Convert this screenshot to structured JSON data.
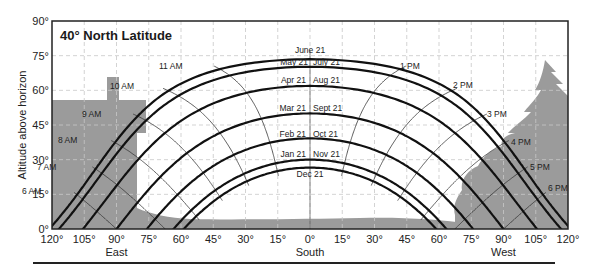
{
  "chart_data": {
    "type": "line",
    "title": "40° North Latitude",
    "xlabel": "Azimuth (East – South – West)",
    "ylabel": "Altitude above horizon",
    "latitude": 40,
    "xlim": [
      -120,
      120
    ],
    "ylim": [
      0,
      90
    ],
    "grid": true,
    "x_ticks": [
      {
        "value": -120,
        "label": "120°"
      },
      {
        "value": -105,
        "label": "105°"
      },
      {
        "value": -90,
        "label": "90°"
      },
      {
        "value": -75,
        "label": "75°"
      },
      {
        "value": -60,
        "label": "60°"
      },
      {
        "value": -45,
        "label": "45°"
      },
      {
        "value": -30,
        "label": "30°"
      },
      {
        "value": -15,
        "label": "15°"
      },
      {
        "value": 0,
        "label": "0°"
      },
      {
        "value": 15,
        "label": "15°"
      },
      {
        "value": 30,
        "label": "30°"
      },
      {
        "value": 45,
        "label": "45°"
      },
      {
        "value": 60,
        "label": "60°"
      },
      {
        "value": 75,
        "label": "75°"
      },
      {
        "value": 90,
        "label": "90°"
      },
      {
        "value": 105,
        "label": "105°"
      },
      {
        "value": 120,
        "label": "120°"
      }
    ],
    "y_ticks": [
      {
        "value": 0,
        "label": "0°"
      },
      {
        "value": 15,
        "label": "15°"
      },
      {
        "value": 30,
        "label": "30°"
      },
      {
        "value": 45,
        "label": "45°"
      },
      {
        "value": 60,
        "label": "60°"
      },
      {
        "value": 75,
        "label": "75°"
      },
      {
        "value": 90,
        "label": "90°"
      }
    ],
    "direction_labels": [
      {
        "value": -90,
        "label": "East"
      },
      {
        "value": 0,
        "label": "South"
      },
      {
        "value": 90,
        "label": "West"
      }
    ],
    "series": [
      {
        "name": "June 21",
        "declination": 23.45,
        "noon_altitude": 73.5
      },
      {
        "name": "May 21 / July 21",
        "declination": 20.2,
        "noon_altitude": 70.2
      },
      {
        "name": "Apr 21 / Aug 21",
        "declination": 11.9,
        "noon_altitude": 61.9
      },
      {
        "name": "Mar 21 / Sept 21",
        "declination": 0,
        "noon_altitude": 50.0
      },
      {
        "name": "Feb 21 / Oct 21",
        "declination": -10.8,
        "noon_altitude": 39.2
      },
      {
        "name": "Jan 21 / Nov 21",
        "declination": -20.0,
        "noon_altitude": 30.0
      },
      {
        "name": "Dec 21",
        "declination": -23.45,
        "noon_altitude": 26.6
      }
    ],
    "date_labels": [
      {
        "text": "June 21",
        "x": 310,
        "y": 53,
        "anchor": "middle"
      },
      {
        "text": "May 21",
        "x": 308,
        "y": 65,
        "anchor": "end"
      },
      {
        "text": "July 21",
        "x": 313,
        "y": 65,
        "anchor": "start"
      },
      {
        "text": "Apr 21",
        "x": 306,
        "y": 83,
        "anchor": "end"
      },
      {
        "text": "Aug 21",
        "x": 313,
        "y": 83,
        "anchor": "start"
      },
      {
        "text": "Mar 21",
        "x": 306,
        "y": 111,
        "anchor": "end"
      },
      {
        "text": "Sept 21",
        "x": 313,
        "y": 111,
        "anchor": "start"
      },
      {
        "text": "Feb 21",
        "x": 306,
        "y": 137,
        "anchor": "end"
      },
      {
        "text": "Oct 21",
        "x": 313,
        "y": 137,
        "anchor": "start"
      },
      {
        "text": "Jan 21",
        "x": 306,
        "y": 157,
        "anchor": "end"
      },
      {
        "text": "Nov 21",
        "x": 313,
        "y": 157,
        "anchor": "start"
      },
      {
        "text": "Dec 21",
        "x": 310,
        "y": 177,
        "anchor": "middle"
      }
    ],
    "hour_lines": [
      {
        "label": "6 AM",
        "hour": -6,
        "lx": 22,
        "ly": 194
      },
      {
        "label": "7 AM",
        "hour": -5,
        "lx": 37,
        "ly": 170
      },
      {
        "label": "8 AM",
        "hour": -4,
        "lx": 58,
        "ly": 143
      },
      {
        "label": "9 AM",
        "hour": -3,
        "lx": 82,
        "ly": 117
      },
      {
        "label": "10 AM",
        "hour": -2,
        "lx": 110,
        "ly": 89
      },
      {
        "label": "11 AM",
        "hour": -1,
        "lx": 159,
        "ly": 69
      },
      {
        "label": "1 PM",
        "hour": 1,
        "lx": 400,
        "ly": 69
      },
      {
        "label": "2 PM",
        "hour": 2,
        "lx": 453,
        "ly": 88
      },
      {
        "label": "3 PM",
        "hour": 3,
        "lx": 487,
        "ly": 117
      },
      {
        "label": "4 PM",
        "hour": 4,
        "lx": 511,
        "ly": 145
      },
      {
        "label": "5 PM",
        "hour": 5,
        "lx": 530,
        "ly": 170
      },
      {
        "label": "6 PM",
        "hour": 6,
        "lx": 548,
        "ly": 191
      }
    ]
  },
  "colors": {
    "background": "#ffffff",
    "obstruction": "#9b9b9b",
    "curve": "#111111",
    "hour_line": "#333333",
    "grid": "#c8c8c8",
    "frame": "#222222"
  }
}
